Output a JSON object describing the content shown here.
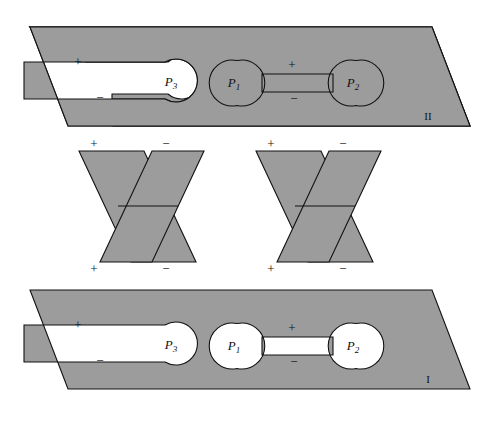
{
  "figure": {
    "background_color": "#ffffff",
    "fill_color": "#9c9c9c",
    "stroke_color": "#111111"
  },
  "planes": [
    {
      "id": "plane-upper",
      "name": "II",
      "ports": [
        {
          "id": "p3",
          "label": "P",
          "subscript": "3"
        },
        {
          "id": "p1",
          "label": "P",
          "subscript": "1"
        },
        {
          "id": "p2",
          "label": "P",
          "subscript": "2"
        }
      ],
      "signs": [
        {
          "id": "p3-plus",
          "text": "+"
        },
        {
          "id": "p3-minus",
          "text": "−"
        },
        {
          "id": "p12-plus",
          "text": "+"
        },
        {
          "id": "p12-minus",
          "text": "−"
        }
      ]
    },
    {
      "id": "plane-lower",
      "name": "I",
      "ports": [
        {
          "id": "p3",
          "label": "P",
          "subscript": "3"
        },
        {
          "id": "p1",
          "label": "P",
          "subscript": "1"
        },
        {
          "id": "p2",
          "label": "P",
          "subscript": "2"
        }
      ],
      "signs": [
        {
          "id": "p3-plus",
          "text": "+"
        },
        {
          "id": "p3-minus",
          "text": "−"
        },
        {
          "id": "p12-plus",
          "text": "+"
        },
        {
          "id": "p12-minus",
          "text": "−"
        }
      ]
    }
  ],
  "connectors": [
    {
      "id": "x-connector-left",
      "signs": {
        "top_left": "+",
        "top_right": "−",
        "bottom_left": "+",
        "bottom_right": "−"
      }
    },
    {
      "id": "x-connector-right",
      "signs": {
        "top_left": "+",
        "top_right": "−",
        "bottom_left": "+",
        "bottom_right": "−"
      }
    }
  ]
}
